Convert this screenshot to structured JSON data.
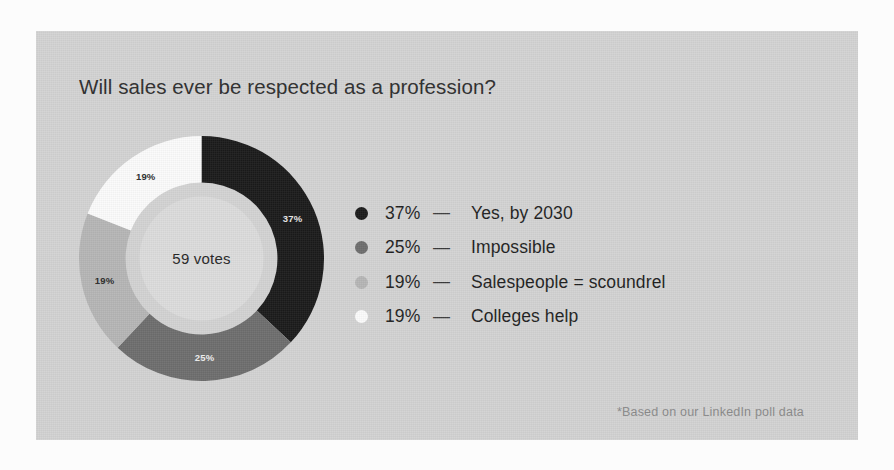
{
  "card": {
    "background_color": "#d3d3d3",
    "page_background_color": "#fcfcfc"
  },
  "title": "Will sales ever be respected as a profession?",
  "center_label": "59 votes",
  "footnote": "*Based on our LinkedIn poll data",
  "legend": {
    "dash": "—",
    "items": [
      {
        "percent": "37%",
        "label": "Yes, by 2030",
        "color": "#1b1b1b"
      },
      {
        "percent": "25%",
        "label": "Impossible",
        "color": "#6e6e6e"
      },
      {
        "percent": "19%",
        "label": "Salespeople = scoundrel",
        "color": "#b6b6b6"
      },
      {
        "percent": "19%",
        "label": "Colleges help",
        "color": "#fbfbfb"
      }
    ]
  },
  "chart_data": {
    "type": "pie",
    "variant": "donut",
    "title": "Will sales ever be respected as a profession?",
    "center_text": "59 votes",
    "total_votes": 59,
    "start_angle_deg": 0,
    "direction": "clockwise",
    "inner_radius_ratio": 0.62,
    "categories": [
      "Yes, by 2030",
      "Impossible",
      "Salespeople = scoundrel",
      "Colleges help"
    ],
    "values": [
      37,
      25,
      19,
      19
    ],
    "value_unit": "percent",
    "slice_labels": [
      "37%",
      "25%",
      "19%",
      "19%"
    ],
    "slice_label_colors": [
      "#e8e8e8",
      "#efefef",
      "#2b2b2b",
      "#2b2b2b"
    ],
    "colors": [
      "#1b1b1b",
      "#6e6e6e",
      "#b6b6b6",
      "#fbfbfb"
    ],
    "legend_position": "right",
    "grid": false,
    "xlabel": "",
    "ylabel": "",
    "annotation": "*Based on our LinkedIn poll data"
  }
}
